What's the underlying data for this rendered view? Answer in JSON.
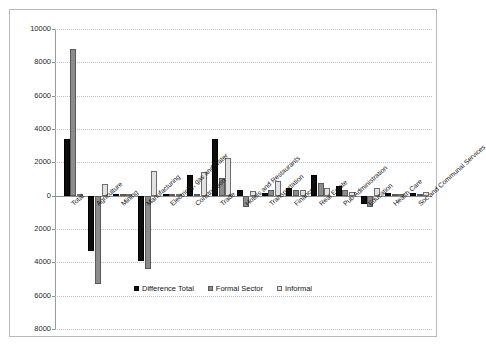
{
  "chart_data": {
    "type": "bar",
    "title": "",
    "subtitle": "",
    "xlabel": "",
    "ylabel": "",
    "ylim": [
      -8000,
      10000
    ],
    "grid": true,
    "legend_position": "bottom",
    "ytick_labels": [
      "10000",
      "8000",
      "6000",
      "4000",
      "2000",
      "0",
      "2000",
      "4000",
      "6000",
      "8000"
    ],
    "ytick_values": [
      10000,
      8000,
      6000,
      4000,
      2000,
      0,
      -2000,
      -4000,
      -6000,
      -8000
    ],
    "categories": [
      "Total",
      "Agriculture",
      "Mining",
      "Manufacturing",
      "Electricity, gas and water",
      "Construction",
      "Trade",
      "Hotels and Restaurants",
      "Transportation",
      "Finance",
      "Real Estate",
      "Pub Administration",
      "Education",
      "Health Care",
      "Soc and Communal Services"
    ],
    "series": [
      {
        "name": "Difference Total",
        "color": "#0d0d0d",
        "values": [
          3400,
          -3300,
          60,
          -3950,
          30,
          1250,
          3400,
          330,
          180,
          480,
          1250,
          600,
          -480,
          160,
          150
        ]
      },
      {
        "name": "Formal Sector",
        "color": "#8c8c8c",
        "values": [
          8800,
          -5300,
          110,
          -4400,
          70,
          70,
          1080,
          -700,
          360,
          330,
          760,
          330,
          -700,
          120,
          40
        ]
      },
      {
        "name": "Informal",
        "color": "#e2e2e2",
        "values": [
          40,
          700,
          30,
          1480,
          90,
          1420,
          2250,
          300,
          900,
          360,
          480,
          240,
          450,
          130,
          230
        ]
      }
    ]
  },
  "legend": {
    "items": [
      {
        "label": "Difference Total",
        "swatch": "black-square-icon"
      },
      {
        "label": "Formal Sector",
        "swatch": "gray-square-icon"
      },
      {
        "label": "Informal",
        "swatch": "light-square-icon"
      }
    ]
  }
}
